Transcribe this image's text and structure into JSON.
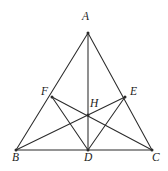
{
  "figure": {
    "background_color": "#ffffff",
    "stroke_color": "#2b2b2b",
    "label_color": "#1c1c1c",
    "width": 168,
    "height": 171,
    "points": {
      "A": {
        "label": "A",
        "x": 88,
        "y": 33,
        "label_x": 82,
        "label_y": 11
      },
      "B": {
        "label": "B",
        "x": 16,
        "y": 150,
        "label_x": 12,
        "label_y": 152
      },
      "C": {
        "label": "C",
        "x": 152,
        "y": 150,
        "label_x": 152,
        "label_y": 152
      },
      "D": {
        "label": "D",
        "x": 88,
        "y": 150,
        "label_x": 84,
        "label_y": 152
      },
      "E": {
        "label": "E",
        "x": 125,
        "y": 97,
        "label_x": 130,
        "label_y": 86
      },
      "F": {
        "label": "F",
        "x": 52,
        "y": 97,
        "label_x": 41,
        "label_y": 86
      },
      "H": {
        "label": "H",
        "x": 88,
        "y": 115,
        "label_x": 90,
        "label_y": 98
      }
    },
    "segments": [
      {
        "name": "side-AB",
        "from": "A",
        "to": "B",
        "kind": "edge"
      },
      {
        "name": "side-AC",
        "from": "A",
        "to": "C",
        "kind": "edge"
      },
      {
        "name": "side-BC",
        "from": "B",
        "to": "C",
        "kind": "edge"
      },
      {
        "name": "altitude-AD",
        "from": "A",
        "to": "D",
        "kind": "cevian"
      },
      {
        "name": "cevian-BE",
        "from": "B",
        "to": "E",
        "kind": "cevian"
      },
      {
        "name": "cevian-CF",
        "from": "C",
        "to": "F",
        "kind": "cevian"
      },
      {
        "name": "chord-FD",
        "from": "F",
        "to": "D",
        "kind": "chord"
      },
      {
        "name": "chord-ED",
        "from": "E",
        "to": "D",
        "kind": "chord"
      }
    ],
    "vertex_dots": [
      "A",
      "B",
      "C",
      "D",
      "E",
      "F",
      "H"
    ]
  }
}
